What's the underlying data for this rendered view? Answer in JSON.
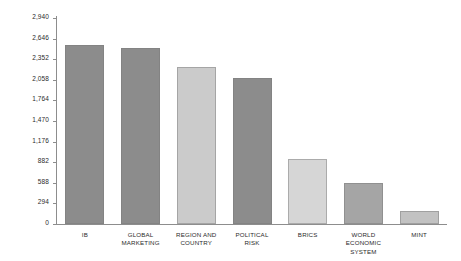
{
  "chart_data": {
    "type": "bar",
    "title": "",
    "subtitle": "",
    "xlabel": "",
    "ylabel": "",
    "categories": [
      "IB",
      "GLOBAL\nMARKETING",
      "REGION AND\nCOUNTRY",
      "POLITICAL\nRISK",
      "BRICS",
      "WORLD ECONOMIC\nSYSTEM",
      "MINT"
    ],
    "values": [
      2560,
      2510,
      2240,
      2085,
      930,
      588,
      180
    ],
    "bar_colors": [
      "#8c8c8c",
      "#8c8c8c",
      "#cbcbcb",
      "#8c8c8c",
      "#d6d6d6",
      "#a5a5a5",
      "#c2c2c2"
    ],
    "ylim": [
      0,
      2940
    ],
    "ytick_values": [
      2940,
      2646,
      2352,
      2058,
      1764,
      1470,
      1176,
      882,
      588,
      294,
      0
    ],
    "ytick_labels": [
      "2,940",
      "2,646",
      "2,352",
      "2,058",
      "1,764",
      "1,470",
      "1,176",
      "882",
      "588",
      "294",
      "0"
    ],
    "grid": false,
    "legend": false,
    "legend_position": "none",
    "axis_color": "#8d8d8d",
    "text_color": "#2b2b2b",
    "background": "#ffffff"
  }
}
